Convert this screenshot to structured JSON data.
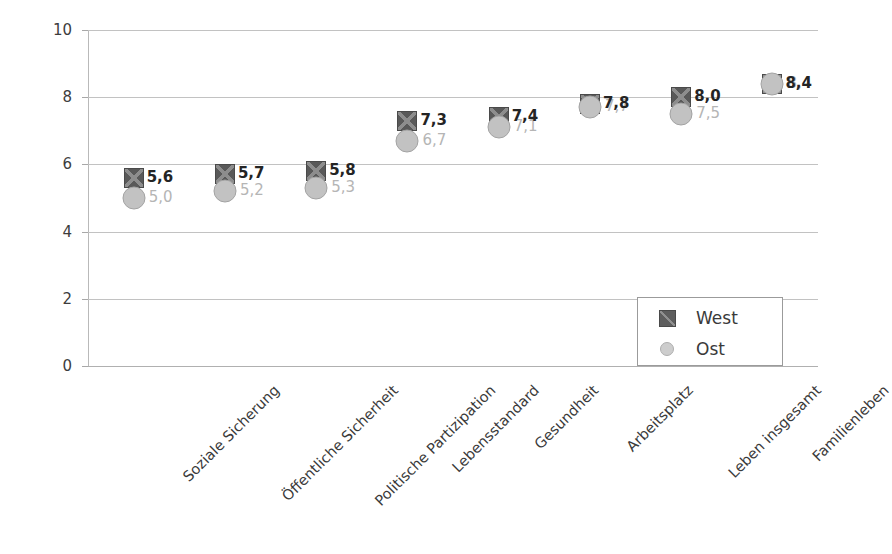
{
  "chart_data": {
    "type": "scatter",
    "title": "",
    "xlabel": "",
    "ylabel": "",
    "ylim": [
      0,
      10
    ],
    "ytick_step": 2,
    "grid": true,
    "legend_position": "bottom-right",
    "categories": [
      "Soziale Sicherung",
      "Öffentliche Sicherheit",
      "Politische Partizipation",
      "Lebensstandard",
      "Gesundheit",
      "Arbeitsplatz",
      "Leben insgesamt",
      "Familienleben"
    ],
    "ytick_labels": [
      "0",
      "2",
      "4",
      "6",
      "8",
      "10"
    ],
    "ytick_values": [
      0,
      2,
      4,
      6,
      8,
      10
    ],
    "series": [
      {
        "name": "West",
        "marker": "square",
        "color": "#595959",
        "values": [
          5.6,
          5.7,
          5.8,
          7.3,
          7.4,
          7.8,
          8.0,
          8.4
        ],
        "labels": [
          "5,6",
          "5,7",
          "5,8",
          "7,3",
          "7,4",
          "7,8",
          "8,0",
          "8,4"
        ]
      },
      {
        "name": "Ost",
        "marker": "circle",
        "color": "#c2c2c2",
        "values": [
          5.0,
          5.2,
          5.3,
          6.7,
          7.1,
          7.7,
          7.5,
          8.4
        ],
        "labels": [
          "5,0",
          "5,2",
          "5,3",
          "6,7",
          "7,1",
          "7,7",
          "7,5",
          "8,4"
        ]
      }
    ]
  },
  "legend": {
    "items": [
      {
        "label": "West",
        "marker": "square-x-icon"
      },
      {
        "label": "Ost",
        "marker": "circle-icon"
      }
    ]
  }
}
